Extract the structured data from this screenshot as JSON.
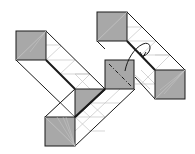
{
  "diagram": {
    "type": "origami-fold-step",
    "width": 195,
    "height": 154,
    "colors": {
      "background": "#ffffff",
      "face_fill": "#a8a8a8",
      "edge": "#1a1a1a",
      "crease": "#bdbdbd",
      "arrow": "#1a1a1a"
    },
    "shaded_squares": [
      {
        "id": "top-left",
        "x": 16,
        "y": 31,
        "size": 30
      },
      {
        "id": "top-right",
        "x": 97,
        "y": 12,
        "size": 30
      },
      {
        "id": "middle",
        "x": 105,
        "y": 60,
        "size": 29
      },
      {
        "id": "right",
        "x": 155,
        "y": 70,
        "size": 30
      },
      {
        "id": "bottom",
        "x": 45,
        "y": 117,
        "size": 30
      }
    ],
    "shaded_triangle": {
      "points": "75,89 105,89 75,117"
    },
    "fold_line": {
      "style": "dash-dot",
      "from": [
        109,
        64
      ],
      "to": [
        131,
        86
      ]
    },
    "arrow": {
      "description": "curved rotate/fold arrow",
      "start": [
        125,
        70
      ],
      "loop": [
        148,
        45
      ],
      "head": [
        143,
        56
      ]
    }
  }
}
